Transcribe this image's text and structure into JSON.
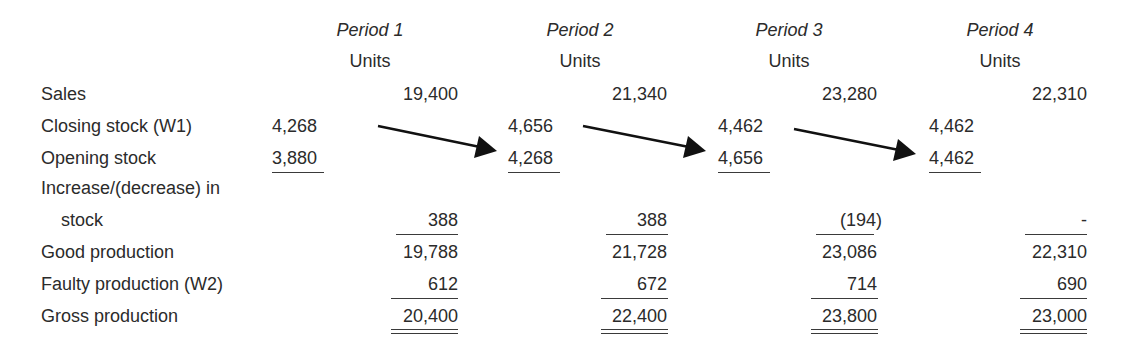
{
  "header": {
    "periods": [
      "Period 1",
      "Period 2",
      "Period 3",
      "Period 4"
    ],
    "units": [
      "Units",
      "Units",
      "Units",
      "Units"
    ]
  },
  "rows": {
    "sales": {
      "label": "Sales",
      "values": [
        "19,400",
        "21,340",
        "23,280",
        "22,310"
      ]
    },
    "closing_stock": {
      "label": "Closing stock (W1)",
      "values": [
        "4,268",
        "4,656",
        "4,462",
        "4,462"
      ]
    },
    "opening_stock": {
      "label": "Opening stock",
      "values": [
        "3,880",
        "4,268",
        "4,656",
        "4,462"
      ]
    },
    "increase_label_1": "Increase/(decrease) in",
    "increase": {
      "label": "stock",
      "values": [
        "388",
        "388",
        "(194)",
        "-"
      ]
    },
    "good_production": {
      "label": "Good production",
      "values": [
        "19,788",
        "21,728",
        "23,086",
        "22,310"
      ]
    },
    "faulty_production": {
      "label": "Faulty production (W2)",
      "values": [
        "612",
        "672",
        "714",
        "690"
      ]
    },
    "gross_production": {
      "label": "Gross production",
      "values": [
        "20,400",
        "22,400",
        "23,800",
        "23,000"
      ]
    }
  },
  "arrows": [
    {
      "from": "Period 1 closing stock",
      "to": "Period 2 opening stock"
    },
    {
      "from": "Period 2 closing stock",
      "to": "Period 3 opening stock"
    },
    {
      "from": "Period 3 closing stock",
      "to": "Period 4 opening stock"
    }
  ]
}
